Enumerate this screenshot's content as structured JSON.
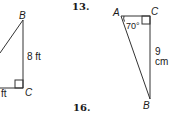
{
  "problems": [
    {
      "number": "13.",
      "triangle": {
        "vertices": {
          "A": "A",
          "B": "B",
          "C": "C"
        },
        "angle_A": "70°",
        "side_BC": "9 cm",
        "right_angle_at": "C"
      }
    },
    {
      "number": "16."
    }
  ],
  "left_figure": {
    "vertices": {
      "B": "B",
      "C": "C"
    },
    "side_BC": "8 ft",
    "bottom_side_partial": "ft",
    "right_angle_at": "C"
  },
  "colors": {
    "line": "#333333",
    "text": "#1a1a1a",
    "background": "#ffffff"
  }
}
